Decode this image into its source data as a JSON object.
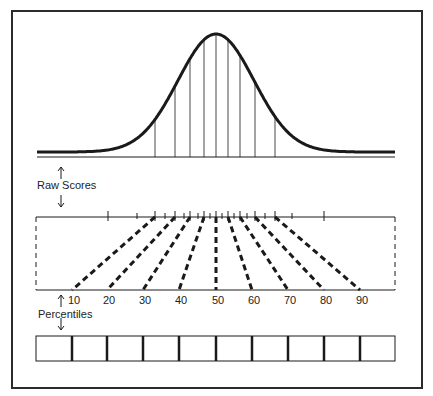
{
  "labels": {
    "raw_scores": "Raw Scores",
    "percentiles": "Percentiles"
  },
  "colors": {
    "ink": "#1a1a1a",
    "frame": "#2b2b2b",
    "background": "#ffffff"
  },
  "curve": {
    "baseline_y": 157,
    "x_start": 37,
    "x_end": 395,
    "peak_x": 216,
    "peak_y": 34,
    "tail_y": 152,
    "percentile_lines_x": [
      155,
      175,
      190,
      204,
      216,
      228,
      240,
      255,
      275
    ]
  },
  "raw_scale": {
    "y": 217,
    "x_start": 36,
    "x_end": 395,
    "ticks_x": [
      108,
      137,
      155,
      165,
      175,
      184,
      190,
      198,
      204,
      210,
      216,
      222,
      228,
      234,
      240,
      247,
      255,
      265,
      275,
      292,
      324
    ],
    "major_ticks_x": [
      108,
      155,
      175,
      190,
      204,
      216,
      228,
      240,
      255,
      275,
      324
    ]
  },
  "percentile_scale": {
    "y": 290,
    "x_start": 36,
    "x_end": 395,
    "values": [
      "10",
      "20",
      "30",
      "40",
      "50",
      "60",
      "70",
      "80",
      "90"
    ],
    "positions_x": [
      72,
      107,
      143,
      179,
      216,
      252,
      288,
      324,
      360
    ]
  },
  "boxes": {
    "y": 336,
    "height": 25,
    "x_start": 36,
    "x_end": 395,
    "dividers_x": [
      72,
      107,
      143,
      179,
      216,
      252,
      288,
      324,
      360
    ]
  }
}
